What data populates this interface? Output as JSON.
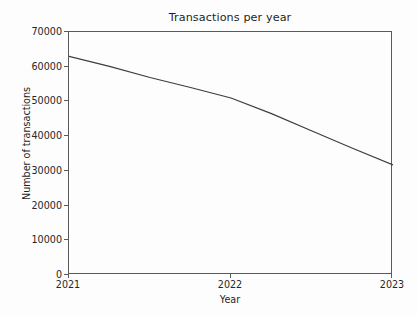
{
  "chart_data": {
    "type": "line",
    "title": "Transactions per year",
    "xlabel": "Year",
    "ylabel": "Number of transactions",
    "x": [
      2021,
      2022,
      2023
    ],
    "categories": [
      "2021",
      "2022",
      "2023"
    ],
    "values": [
      63000,
      51000,
      31700
    ],
    "series": [
      {
        "name": "Number of transactions",
        "values": [
          63000,
          51000,
          31700
        ]
      }
    ],
    "dense_x": [
      2021.0,
      2021.25,
      2021.5,
      2021.75,
      2022.0,
      2022.25,
      2022.5,
      2022.75,
      2023.0
    ],
    "dense_y": [
      63000,
      60100,
      56900,
      54000,
      51000,
      46500,
      41500,
      36500,
      31700
    ],
    "xlim": [
      2021,
      2023
    ],
    "ylim": [
      0,
      70000
    ],
    "xticks": [
      "2021",
      "2022",
      "2023"
    ],
    "xtick_values": [
      2021,
      2022,
      2023
    ],
    "yticks": [
      "0",
      "10000",
      "20000",
      "30000",
      "40000",
      "50000",
      "60000",
      "70000"
    ],
    "ytick_values": [
      0,
      10000,
      20000,
      30000,
      40000,
      50000,
      60000,
      70000
    ],
    "grid": false,
    "legend": false,
    "legend_position": "none",
    "line_color": "#3d3d3d",
    "line_width": 1.2,
    "axis_color": "#5a5a5a",
    "background_color": "#fdfdfd",
    "text_color": "#1f1f1f"
  }
}
